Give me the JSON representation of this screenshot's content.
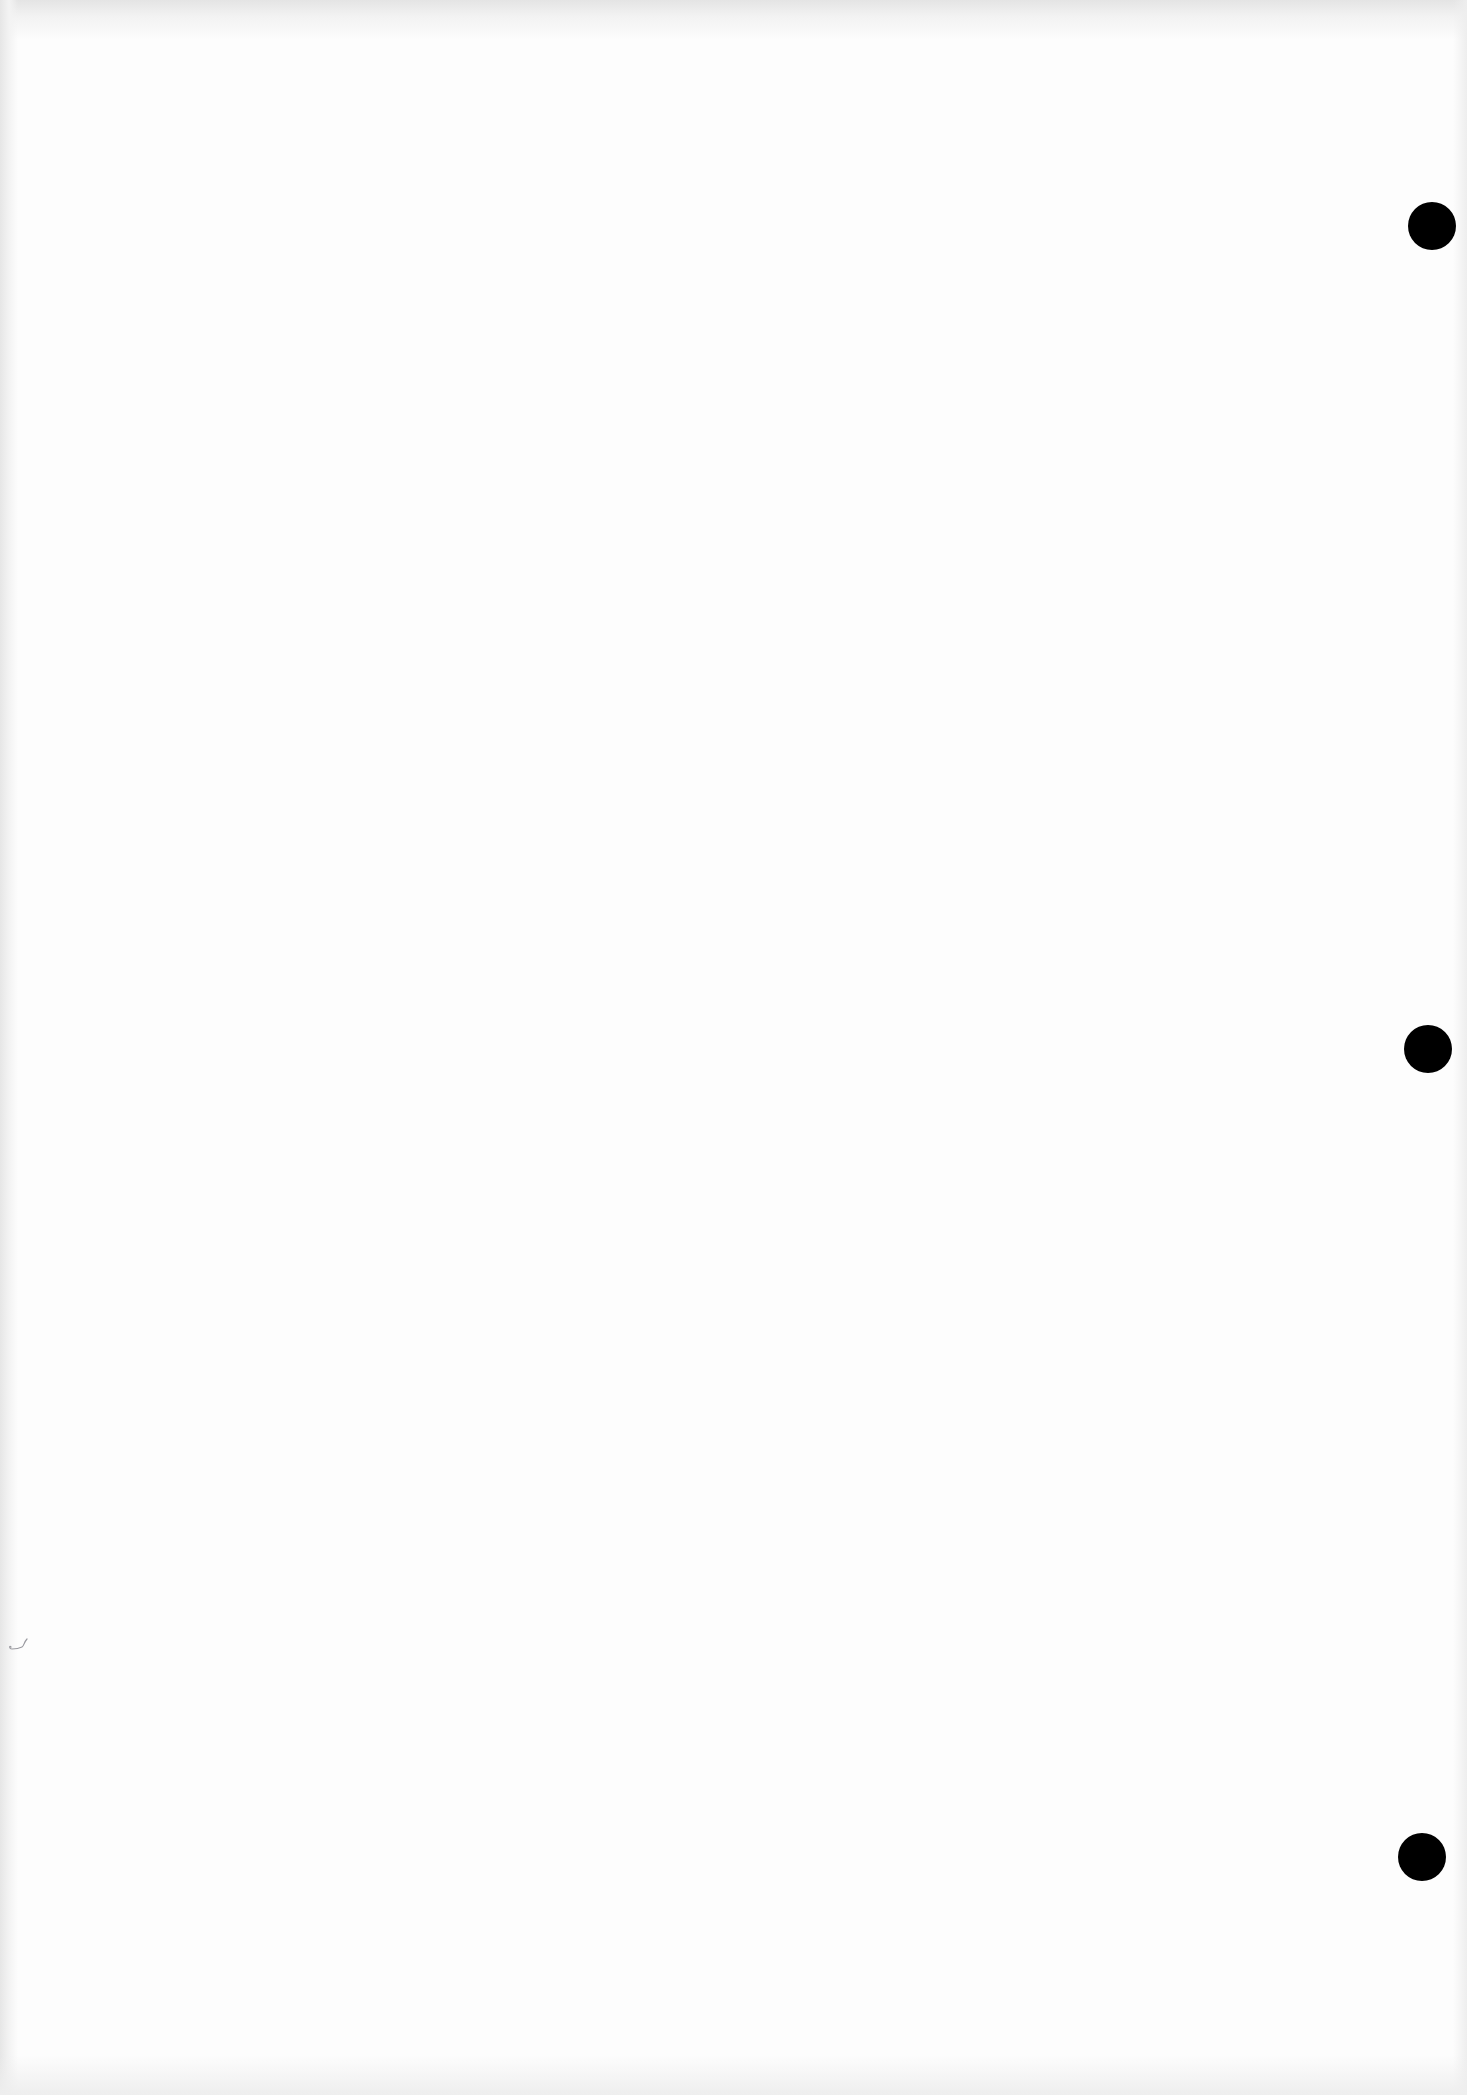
{
  "document": {
    "type": "blank-scanned-page",
    "text": "",
    "punch_holes": [
      {
        "cx": 1432,
        "cy": 226,
        "r": 24
      },
      {
        "cx": 1428,
        "cy": 1049,
        "r": 24
      },
      {
        "cx": 1422,
        "cy": 1857,
        "r": 24
      }
    ],
    "colors": {
      "paper": "#fdfdfd",
      "hole": "#000000",
      "mark": "#9a9aa0"
    }
  }
}
